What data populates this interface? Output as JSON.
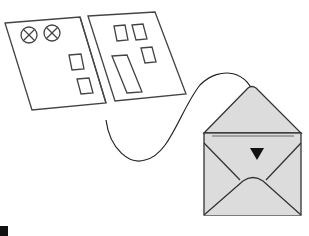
{
  "diagram": {
    "elements": [
      {
        "id": "folder",
        "label": "folder-with-windows"
      },
      {
        "id": "arrow",
        "label": "curved-arrow"
      },
      {
        "id": "envelope",
        "label": "open-envelope"
      }
    ],
    "colors": {
      "stroke": "#333333",
      "envelope_fill": "#d9d9d9",
      "background": "#ffffff"
    }
  }
}
